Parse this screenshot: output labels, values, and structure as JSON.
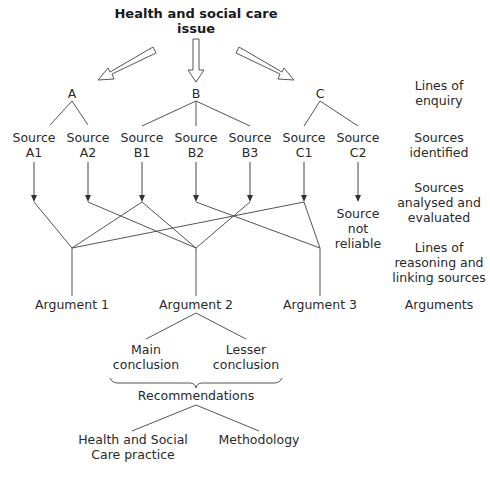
{
  "title": {
    "line1": "Health and social care",
    "line2": "issue"
  },
  "enquiry": [
    {
      "label": "A",
      "x": 72
    },
    {
      "label": "B",
      "x": 196
    },
    {
      "label": "C",
      "x": 320
    }
  ],
  "sources": [
    {
      "l1": "Source",
      "l2": "A1",
      "x": 34
    },
    {
      "l1": "Source",
      "l2": "A2",
      "x": 88
    },
    {
      "l1": "Source",
      "l2": "B1",
      "x": 142
    },
    {
      "l1": "Source",
      "l2": "B2",
      "x": 196
    },
    {
      "l1": "Source",
      "l2": "B3",
      "x": 250
    },
    {
      "l1": "Source",
      "l2": "C1",
      "x": 304
    },
    {
      "l1": "Source",
      "l2": "C2",
      "x": 358
    }
  ],
  "not_reliable": {
    "l1": "Source",
    "l2": "not",
    "l3": "reliable"
  },
  "arguments": [
    {
      "label": "Argument 1",
      "x": 72
    },
    {
      "label": "Argument 2",
      "x": 196
    },
    {
      "label": "Argument 3",
      "x": 320
    }
  ],
  "conclusions": {
    "main": {
      "l1": "Main",
      "l2": "conclusion"
    },
    "lesser": {
      "l1": "Lesser",
      "l2": "conclusion"
    }
  },
  "recommendations": "Recommendations",
  "outcomes": {
    "practice": {
      "l1": "Health and Social",
      "l2": "Care practice"
    },
    "methodology": "Methodology"
  },
  "stage_labels": [
    {
      "l1": "Lines of",
      "l2": "enquiry"
    },
    {
      "l1": "Sources",
      "l2": "identified"
    },
    {
      "l1": "Sources",
      "l2": "analysed and",
      "l3": "evaluated"
    },
    {
      "l1": "Lines of",
      "l2": "reasoning and",
      "l3": "linking sources"
    },
    {
      "l1": "Arguments"
    }
  ],
  "colors": {
    "line": "#444444",
    "text": "#2a2a2a"
  }
}
